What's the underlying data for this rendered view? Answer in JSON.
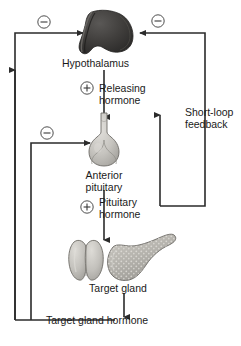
{
  "diagram": {
    "colors": {
      "line": "#2b2b2b",
      "text": "#1a1a1a",
      "hypothalamus_dark": "#3c3b3a",
      "hypothalamus_darker": "#2a2928",
      "hypothalamus_mid": "#565452",
      "pituitary_light": "#cfcdc8",
      "pituitary_shade": "#a9a7a2",
      "thyroid_light": "#c9c7c2",
      "pancreas_gray": "#b6b4ae",
      "background": "#ffffff"
    },
    "nodes": [
      {
        "id": "hypothalamus",
        "label": "Hypothalamus"
      },
      {
        "id": "anterior-pituitary",
        "label_line1": "Anterior",
        "label_line2": "pituitary"
      },
      {
        "id": "target-gland",
        "label": "Target gland"
      }
    ],
    "arrows": [
      {
        "id": "releasing-hormone",
        "sign": "⊖",
        "sign_type": "plus",
        "label_line1": "Releasing",
        "label_line2": "hormone"
      },
      {
        "id": "pituitary-hormone",
        "label_line1": "Pituitary",
        "label_line2": "hormone"
      }
    ],
    "labels": {
      "releasing_hormone_1": "Releasing",
      "releasing_hormone_2": "hormone",
      "pituitary_hormone_1": "Pituitary",
      "pituitary_hormone_2": "hormone",
      "short_loop_1": "Short-loop",
      "short_loop_2": "feedback",
      "target_gland_hormone": "Target gland hormone"
    },
    "signs": {
      "minus": "–",
      "plus": "+",
      "minus_top_left": "–",
      "minus_top_right": "–",
      "minus_mid_left": "–",
      "plus_releasing": "+",
      "plus_pituitary": "+"
    }
  }
}
